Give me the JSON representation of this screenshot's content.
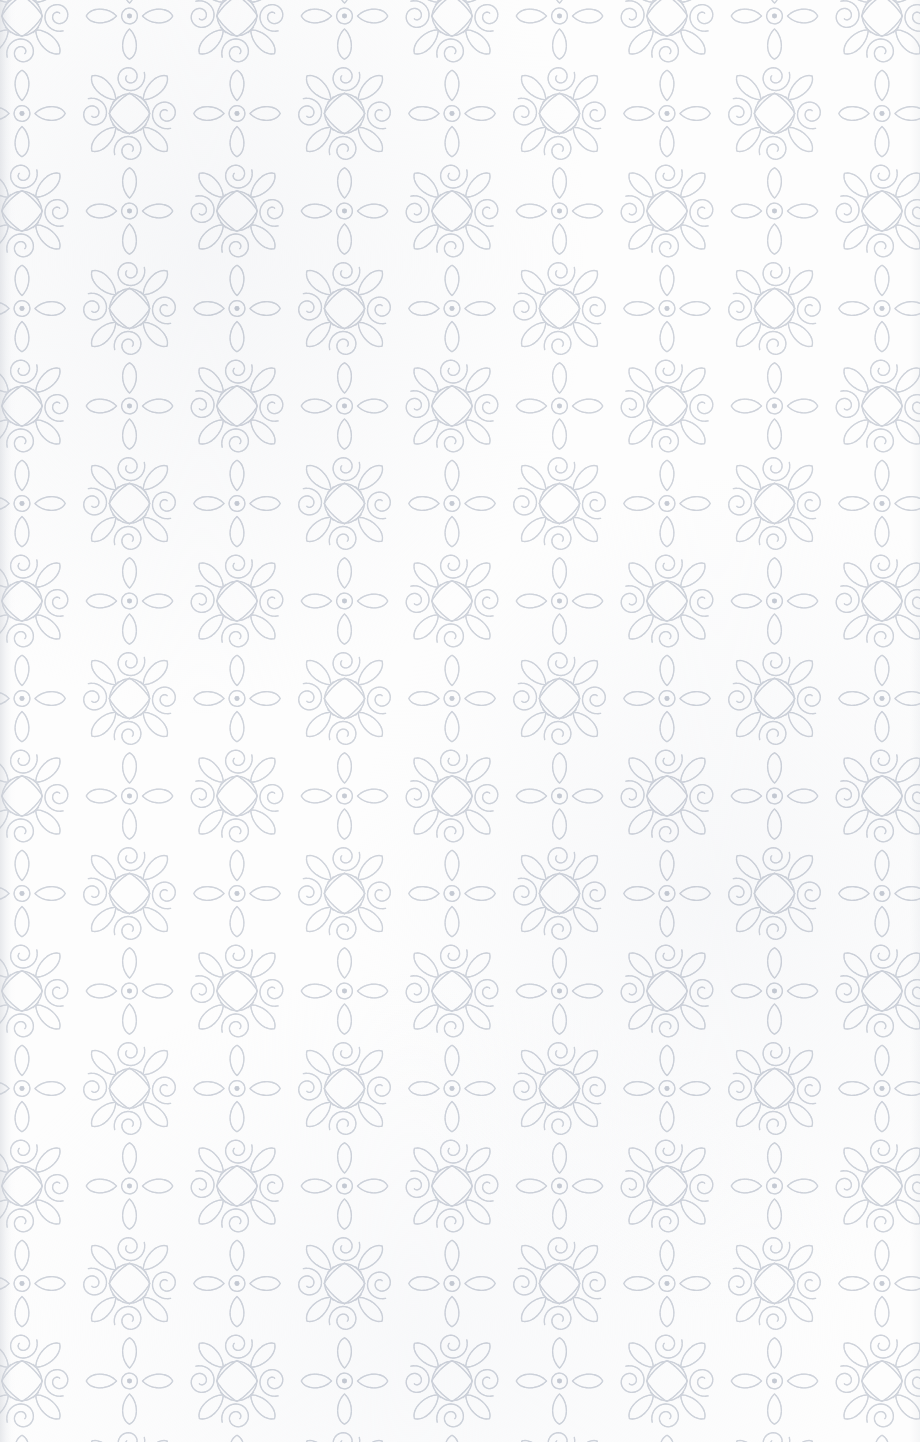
{
  "document": {
    "kind": "scanned-wallpaper-swatch",
    "title": "Damask Scroll Wallpaper Pattern",
    "width_px": 920,
    "height_px": 1442
  },
  "palette": {
    "background": "#fdfdfd",
    "paper_warm_white": "#f7f8fa",
    "line_primary": "#c5cad3",
    "line_soft": "#d6dae1",
    "line_faint": "#e2e5ea",
    "edge_shadow": "#c4c8d0"
  },
  "pattern": {
    "name": "two-motif damask scroll lattice",
    "repeat": {
      "width_px": 215,
      "height_px": 195
    },
    "arrangement": "checkerboard — the two motifs alternate, each offset by half a tile on both axes",
    "clipped_edges": [
      "top",
      "right",
      "bottom",
      "left"
    ],
    "stroke": {
      "color": "#c5cad3",
      "width_px": 1.35,
      "texture": "slightly broken / embroidered stitch-like edge",
      "linecap": "round"
    },
    "motifs": [
      {
        "id": "pinwheel-scroll",
        "label": "Pinwheel scroll medallion",
        "description": "A small central diamond formed by four crossing arcs, with a teardrop loop springing from each of the four diagonal corners and a spiral C-scroll curling outward at each cardinal point.",
        "elements": {
          "central_diamond": 1,
          "teardrop_loops": 4,
          "spiral_scrolls": 4
        },
        "symmetry": "4-fold rotational (C4)",
        "approx_size_px": 132
      },
      {
        "id": "dot-flower",
        "label": "Four-petal dot flower",
        "description": "Four elongated teardrop petals pointing north, south, east and west around a small concentric ring with a solid dot at its centre.",
        "elements": {
          "petals": 4,
          "center_ring": 1,
          "center_dot": 1
        },
        "symmetry": "4-fold rotational (C4)",
        "approx_size_px": 96
      }
    ],
    "lattice_origin": {
      "x_px": 22,
      "y_px": 16
    }
  },
  "overlays": {
    "left_edge_shadow": {
      "visible": true,
      "width_px": 16
    },
    "right_edge_shadow": {
      "visible": true,
      "width_px": 10
    },
    "paper_grain": {
      "visible": true
    }
  }
}
